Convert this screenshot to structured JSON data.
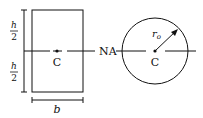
{
  "rectangle_section": {
    "height_half_numerator": "h",
    "height_half_denominator": "2",
    "width_label": "b",
    "centroid_label": "C"
  },
  "neutral_axis_label": "NA",
  "circle_section": {
    "radius_label": "r",
    "radius_subscript": "o",
    "centroid_label": "C"
  },
  "colors": {
    "stroke": "#111111",
    "background": "#ffffff"
  }
}
